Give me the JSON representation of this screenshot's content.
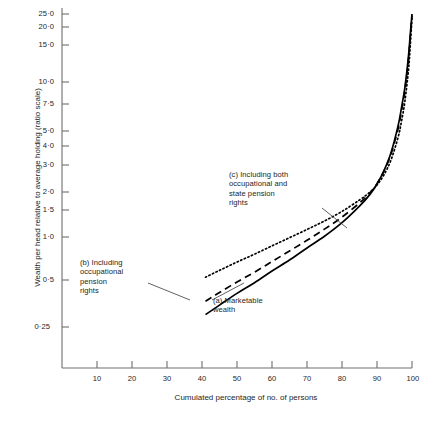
{
  "chart_data": {
    "type": "line",
    "title": "",
    "xlabel": "Cumulated percentage of no. of persons",
    "ylabel": "Wealth per head relative to average holding (ratio scale)",
    "xlim": [
      0,
      100
    ],
    "ylim": [
      0.25,
      25.0
    ],
    "yscale": "log",
    "grid": false,
    "legend_position": "inline-annotations",
    "xticks": [
      "10",
      "20",
      "30",
      "40",
      "50",
      "60",
      "70",
      "80",
      "90",
      "100"
    ],
    "xtick_values": [
      10,
      20,
      30,
      40,
      50,
      60,
      70,
      80,
      90,
      100
    ],
    "yticks": [
      "25·0",
      "20·0",
      "15·0",
      "10·0",
      "7·5",
      "5·0",
      "4·0",
      "3·0",
      "2·0",
      "1·5",
      "1·0",
      "0·5",
      "0·25"
    ],
    "ytick_values": [
      25.0,
      20.0,
      15.0,
      10.0,
      7.5,
      5.0,
      4.0,
      3.0,
      2.0,
      1.5,
      1.0,
      0.5,
      0.25
    ],
    "series": [
      {
        "name": "(a) Marketable wealth",
        "style": "solid",
        "color": "#000000",
        "x": [
          41,
          45,
          50,
          55,
          60,
          65,
          70,
          75,
          80,
          85,
          88,
          90,
          92,
          94,
          96,
          97,
          98,
          99,
          99.5,
          100
        ],
        "y": [
          0.3,
          0.345,
          0.41,
          0.48,
          0.57,
          0.67,
          0.8,
          0.95,
          1.16,
          1.48,
          1.76,
          2.05,
          2.5,
          3.25,
          4.8,
          6.3,
          8.6,
          13.5,
          18.5,
          25.0
        ]
      },
      {
        "name": "(b) Including occupational pension rights",
        "style": "dashed",
        "color": "#000000",
        "x": [
          41,
          45,
          50,
          55,
          60,
          65,
          70,
          75,
          80,
          85,
          88,
          90,
          92,
          94,
          96,
          97,
          98,
          99,
          99.5,
          100
        ],
        "y": [
          0.365,
          0.415,
          0.485,
          0.56,
          0.655,
          0.765,
          0.895,
          1.055,
          1.26,
          1.55,
          1.8,
          2.06,
          2.48,
          3.18,
          4.6,
          6.0,
          8.2,
          12.9,
          17.8,
          24.5
        ]
      },
      {
        "name": "(c) Including both occupational and state pension rights",
        "style": "dotted",
        "color": "#000000",
        "x": [
          41,
          45,
          50,
          55,
          60,
          65,
          70,
          75,
          80,
          85,
          88,
          90,
          92,
          94,
          96,
          97,
          98,
          99,
          99.5,
          100
        ],
        "y": [
          0.52,
          0.575,
          0.65,
          0.73,
          0.825,
          0.93,
          1.05,
          1.19,
          1.37,
          1.62,
          1.82,
          2.02,
          2.35,
          2.92,
          4.05,
          5.15,
          7.0,
          11.0,
          15.6,
          23.5
        ]
      }
    ],
    "annotations": [
      {
        "id": "c",
        "text": "(c) Including both\noccupational and\nstate pension\nrights",
        "leader_from": [
          322,
          208
        ],
        "leader_to": [
          347,
          228
        ]
      },
      {
        "id": "b",
        "text": "(b) Including\noccupational\npension\nrights",
        "leader_from": [
          148,
          283
        ],
        "leader_to": [
          190,
          300
        ]
      },
      {
        "id": "a",
        "text": "(a) Marketable\nwealth",
        "leader_from": [
          212,
          300
        ],
        "leader_to": [
          244,
          283
        ]
      }
    ]
  }
}
